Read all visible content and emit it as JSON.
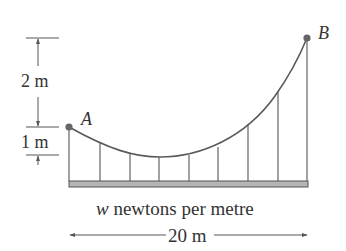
{
  "diagram": {
    "type": "suspension-cable",
    "points": {
      "A": {
        "label": "A"
      },
      "B": {
        "label": "B"
      }
    },
    "dimensions": {
      "upper_height": "2 m",
      "lower_height": "1 m",
      "span": "20 m"
    },
    "load": {
      "symbol": "w",
      "text": " newtons per metre"
    },
    "hanger_count": 9,
    "colors": {
      "line": "#555555",
      "cable": "#5a5a5a",
      "deck_fill": "#b5b5b5",
      "point": "#666666",
      "text": "#333333"
    }
  }
}
